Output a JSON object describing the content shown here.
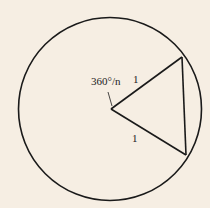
{
  "diagram": {
    "angle_label": "360°/n",
    "side_top_label": "1",
    "side_bottom_label": "1",
    "colors": {
      "background": "#f6eee3",
      "stroke": "#1a1a1a"
    }
  }
}
